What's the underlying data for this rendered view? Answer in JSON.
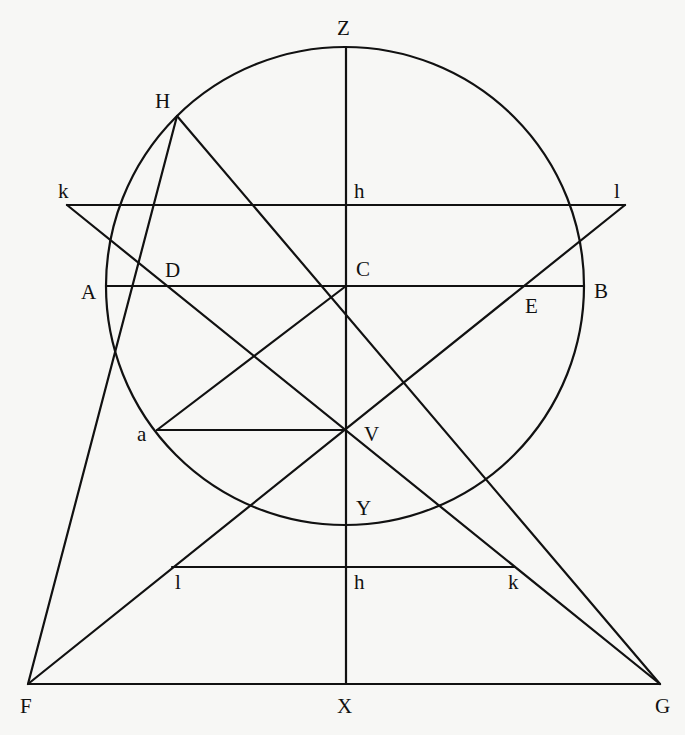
{
  "diagram": {
    "type": "geometric-construction",
    "points": {
      "Z": "Z",
      "H": "H",
      "k_upper": "k",
      "h_upper": "h",
      "l_upper": "l",
      "D": "D",
      "A": "A",
      "C": "C",
      "E": "E",
      "B": "B",
      "a": "a",
      "V": "V",
      "Y": "Y",
      "l_lower": "l",
      "h_lower": "h",
      "k_lower": "k",
      "F": "F",
      "X": "X",
      "G": "G"
    },
    "segments": [
      {
        "name": "Z-X",
        "from": "Z",
        "to": "X"
      },
      {
        "name": "k-l upper",
        "from": "k",
        "to": "l"
      },
      {
        "name": "A-B",
        "from": "A",
        "to": "B"
      },
      {
        "name": "a-V",
        "from": "a",
        "to": "V"
      },
      {
        "name": "l-k lower",
        "from": "l",
        "to": "k"
      },
      {
        "name": "F-G",
        "from": "F",
        "to": "G"
      },
      {
        "name": "H-F",
        "from": "H",
        "to": "F"
      },
      {
        "name": "H-G",
        "from": "H",
        "to": "G"
      },
      {
        "name": "k-G",
        "from": "k",
        "to": "G"
      },
      {
        "name": "l-F",
        "from": "l",
        "to": "F"
      },
      {
        "name": "C-a",
        "from": "C",
        "to": "a"
      }
    ],
    "circle": {
      "center": "C",
      "through": [
        "Z",
        "Y",
        "A",
        "B",
        "H"
      ]
    }
  }
}
